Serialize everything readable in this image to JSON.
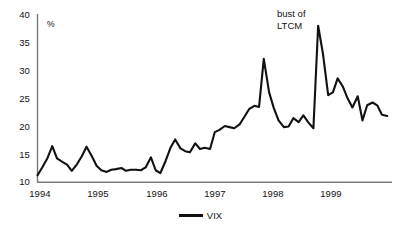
{
  "chart_data": {
    "type": "line",
    "title": "",
    "xlabel": "",
    "ylabel": "",
    "unit_label": "%",
    "ylim": [
      10,
      40
    ],
    "yticks": [
      10,
      15,
      20,
      25,
      30,
      35,
      40
    ],
    "xlim": [
      1994.0,
      2000.0
    ],
    "xticks": [
      1994,
      1995,
      1996,
      1997,
      1998,
      1999
    ],
    "xtick_labels": [
      "1994",
      "1995",
      "1996",
      "1997",
      "1998",
      "1999"
    ],
    "ytick_labels": [
      "10",
      "15",
      "20",
      "25",
      "30",
      "35",
      "40"
    ],
    "grid": false,
    "legend_position": "bottom-center",
    "annotations": [
      {
        "text_line1": "bust of",
        "text_line2": "LTCM",
        "x": 1998.55,
        "y": 39.5
      }
    ],
    "series": [
      {
        "name": "VIX",
        "color": "#111111",
        "x": [
          1994.0,
          1994.08,
          1994.17,
          1994.25,
          1994.33,
          1994.42,
          1994.5,
          1994.58,
          1994.67,
          1994.75,
          1994.83,
          1994.92,
          1995.0,
          1995.08,
          1995.17,
          1995.25,
          1995.33,
          1995.42,
          1995.5,
          1995.58,
          1995.67,
          1995.75,
          1995.83,
          1995.92,
          1996.0,
          1996.08,
          1996.17,
          1996.25,
          1996.33,
          1996.42,
          1996.5,
          1996.58,
          1996.67,
          1996.75,
          1996.83,
          1996.92,
          1997.0,
          1997.08,
          1997.17,
          1997.25,
          1997.33,
          1997.42,
          1997.5,
          1997.58,
          1997.67,
          1997.75,
          1997.83,
          1997.92,
          1998.0,
          1998.08,
          1998.17,
          1998.25,
          1998.33,
          1998.42,
          1998.5,
          1998.58,
          1998.67,
          1998.75,
          1998.83,
          1998.92,
          1999.0,
          1999.08,
          1999.17,
          1999.25,
          1999.33,
          1999.42,
          1999.5,
          1999.58,
          1999.67,
          1999.75,
          1999.83,
          1999.92
        ],
        "values": [
          11.2,
          12.6,
          14.3,
          16.4,
          14.2,
          13.6,
          13.1,
          12.0,
          13.2,
          14.6,
          16.3,
          14.6,
          12.9,
          12.1,
          11.8,
          12.2,
          12.3,
          12.5,
          12.0,
          12.2,
          12.2,
          12.1,
          12.6,
          14.4,
          12.1,
          11.6,
          13.8,
          16.1,
          17.6,
          16.0,
          15.5,
          15.3,
          16.9,
          15.9,
          16.1,
          15.9,
          18.9,
          19.3,
          20.0,
          19.8,
          19.6,
          20.3,
          21.6,
          23.0,
          23.6,
          23.4,
          32.0,
          26.0,
          23.2,
          21.0,
          19.8,
          19.9,
          21.4,
          20.7,
          21.9,
          20.7,
          19.6,
          37.9,
          33.0,
          25.5,
          26.0,
          28.5,
          27.0,
          24.9,
          23.3,
          25.3,
          21.0,
          23.7,
          24.2,
          23.7,
          22.0,
          21.8
        ]
      }
    ],
    "legend": [
      {
        "label": "VIX",
        "color": "#111111"
      }
    ]
  },
  "axes": {
    "y_axis_color": "#7a7a7a",
    "x_axis_color": "#7a7a7a"
  }
}
